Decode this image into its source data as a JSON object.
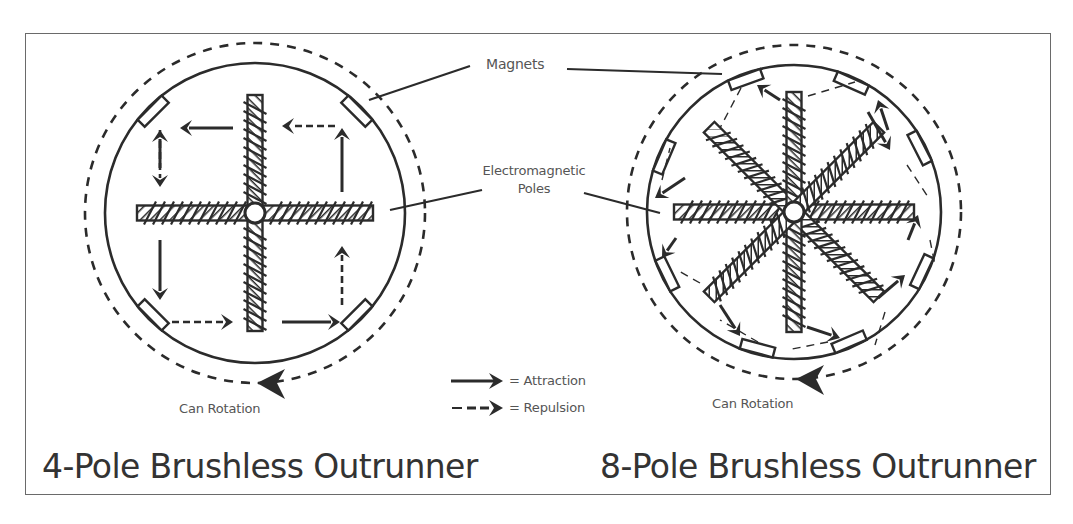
{
  "figure": {
    "frame": {
      "x": 25,
      "y": 33,
      "w": 1026,
      "h": 462
    },
    "colors": {
      "ink": "#2b2b2b",
      "label": "#555555",
      "title": "#333333",
      "frame": "#6a6a6a",
      "background": "#ffffff"
    }
  },
  "labels": {
    "magnets": "Magnets",
    "electromagnetic_poles_line1": "Electromagnetic",
    "electromagnetic_poles_line2": "Poles",
    "can_rotation": "Can Rotation"
  },
  "legend": {
    "attraction": {
      "symbol": "solid-arrow",
      "label": "= Attraction"
    },
    "repulsion": {
      "symbol": "dashed-arrow",
      "label": "= Repulsion"
    }
  },
  "diagrams": [
    {
      "id": "four-pole",
      "title": "4-Pole Brushless Outrunner",
      "center": [
        255,
        213
      ],
      "stator_radius": 150,
      "can_radius": 170,
      "pole_count": 4,
      "pole_angles_deg": [
        0,
        90,
        180,
        270
      ],
      "magnet_angles_deg": [
        -135,
        -45,
        45,
        135
      ],
      "rotation_label": "Can Rotation",
      "rotation_direction": "counterclockwise"
    },
    {
      "id": "eight-pole",
      "title": "8-Pole Brushless Outrunner",
      "center": [
        794,
        212
      ],
      "stator_radius": 147,
      "can_radius": 167,
      "pole_count": 8,
      "pole_angles_deg": [
        0,
        45,
        90,
        135,
        180,
        225,
        270,
        315
      ],
      "magnet_angles_deg": [
        -157,
        -110,
        -66,
        -27,
        25,
        67,
        105,
        154
      ],
      "rotation_label": "Can Rotation",
      "rotation_direction": "counterclockwise"
    }
  ]
}
